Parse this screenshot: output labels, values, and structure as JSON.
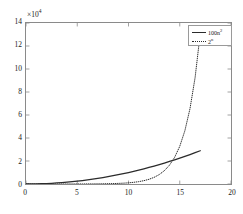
{
  "chart_data": {
    "type": "line",
    "title": "",
    "xlabel": "",
    "ylabel": "",
    "y_multiplier": "×10",
    "y_multiplier_exp": "4",
    "xlim": [
      0,
      20
    ],
    "ylim": [
      0,
      140000
    ],
    "xticks": [
      "0",
      "5",
      "10",
      "15",
      "20"
    ],
    "xtick_values": [
      0,
      5,
      10,
      15,
      20
    ],
    "yticks": [
      "0",
      "2",
      "4",
      "6",
      "8",
      "10",
      "12",
      "14"
    ],
    "ytick_values": [
      0,
      20000,
      40000,
      60000,
      80000,
      100000,
      120000,
      140000
    ],
    "grid": false,
    "legend_position": "top-right",
    "series": [
      {
        "name": "100n",
        "name_exp": "2",
        "style": "solid",
        "color": "#2b2b2b",
        "x": [
          0,
          0.5,
          1,
          1.5,
          2,
          2.5,
          3,
          3.5,
          4,
          4.5,
          5,
          5.5,
          6,
          6.5,
          7,
          7.5,
          8,
          8.5,
          9,
          9.5,
          10,
          10.5,
          11,
          11.5,
          12,
          12.5,
          13,
          13.5,
          14,
          14.5,
          15,
          15.5,
          16,
          16.5,
          17
        ],
        "values": [
          0,
          25,
          100,
          225,
          400,
          625,
          900,
          1225,
          1600,
          2025,
          2500,
          3025,
          3600,
          4225,
          4900,
          5625,
          6400,
          7225,
          8100,
          9025,
          10000,
          11025,
          12100,
          13225,
          14400,
          15625,
          16900,
          18225,
          19600,
          21025,
          22500,
          24025,
          25600,
          27225,
          28900
        ]
      },
      {
        "name": "2",
        "name_exp": "n",
        "style": "dotted",
        "color": "#2b2b2b",
        "x": [
          0,
          0.5,
          1,
          1.5,
          2,
          2.5,
          3,
          3.5,
          4,
          4.5,
          5,
          5.5,
          6,
          6.5,
          7,
          7.5,
          8,
          8.5,
          9,
          9.5,
          10,
          10.5,
          11,
          11.5,
          12,
          12.5,
          13,
          13.5,
          14,
          14.5,
          15,
          15.5,
          16,
          16.5,
          17
        ],
        "values": [
          1,
          1.41,
          2,
          2.83,
          4,
          5.66,
          8,
          11.3,
          16,
          22.6,
          32,
          45.3,
          64,
          90.5,
          128,
          181,
          256,
          362,
          512,
          724,
          1024,
          1448,
          2048,
          2896,
          4096,
          5793,
          8192,
          11585,
          16384,
          23170,
          32768,
          46341,
          65536,
          92682,
          131072
        ]
      }
    ],
    "annotations": {
      "crossover_x": 14.5,
      "note": "curves intersect near n=14.5"
    }
  },
  "legend": {
    "entries": [
      {
        "label": "100n",
        "exp": "2",
        "style": "solid"
      },
      {
        "label": "2",
        "exp": "n",
        "style": "dotted"
      }
    ]
  }
}
